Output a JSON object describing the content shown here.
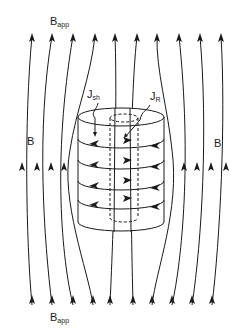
{
  "labels": {
    "b_app_top": {
      "main": "B",
      "sub": "app"
    },
    "b_app_bottom": {
      "main": "B",
      "sub": "app"
    },
    "b_left": "B",
    "b_right": "B",
    "j_sh": {
      "main": "J",
      "sub": "sh"
    },
    "j_r": {
      "main": "J",
      "sub": "R"
    }
  },
  "colors": {
    "stroke": "#1a1a1a",
    "background": "#ffffff"
  },
  "diagram": {
    "field_line_count": 10,
    "current_loops": 4
  }
}
